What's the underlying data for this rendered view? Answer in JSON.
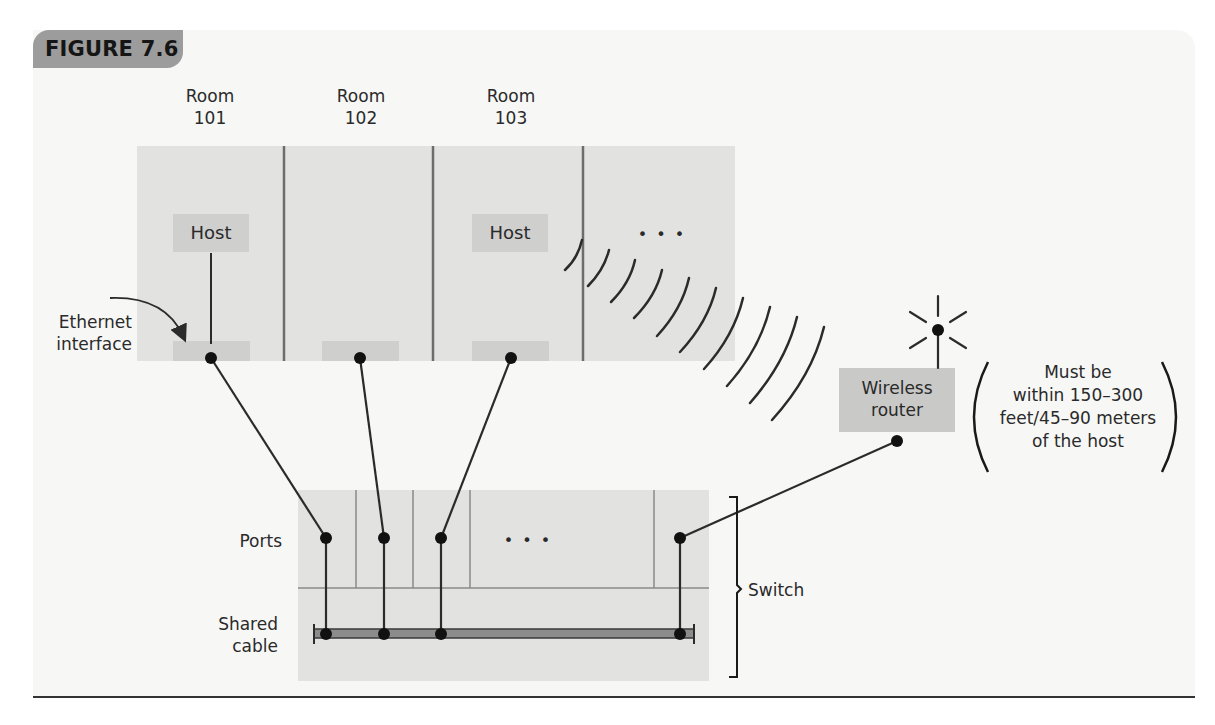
{
  "figure": {
    "label": "FIGURE 7.6"
  },
  "rooms": [
    {
      "title_line1": "Room",
      "title_line2": "101",
      "host_label": "Host",
      "has_host": true
    },
    {
      "title_line1": "Room",
      "title_line2": "102",
      "has_host": false
    },
    {
      "title_line1": "Room",
      "title_line2": "103",
      "host_label": "Host",
      "has_host": true
    },
    {
      "ellipsis": "• • •"
    }
  ],
  "labels": {
    "ethernet_interface_line1": "Ethernet",
    "ethernet_interface_line2": "interface",
    "ports": "Ports",
    "shared_cable_line1": "Shared",
    "shared_cable_line2": "cable",
    "switch": "Switch",
    "switch_ellipsis": "• • •"
  },
  "router": {
    "label_line1": "Wireless",
    "label_line2": "router"
  },
  "range_note": {
    "line1": "Must be",
    "line2": "within 150–300",
    "line3": "feet/45–90 meters",
    "line4": "of the host"
  },
  "colors": {
    "panel_bg": "#f7f7f6",
    "box_fill": "#e2e2e1",
    "host_fill": "#cfcfce",
    "tab_fill": "#9c9c9c",
    "line": "#2b2b2b"
  }
}
